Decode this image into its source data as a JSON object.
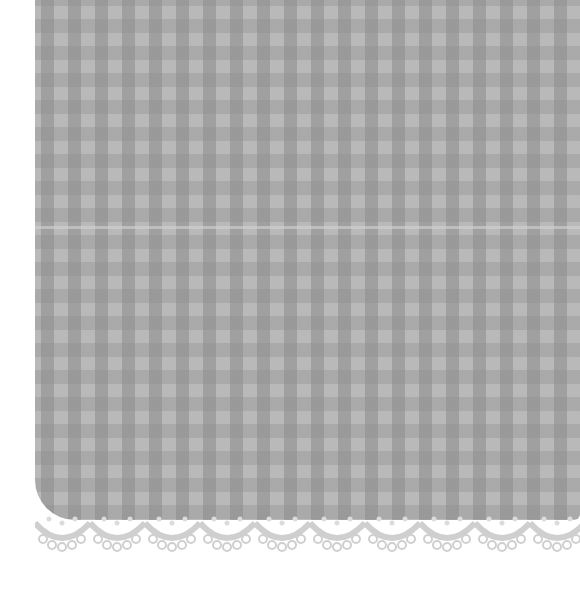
{
  "image": {
    "subject": "Gray gingham fabric with scalloped lace trim",
    "colors": {
      "background": "#ffffff",
      "fabric_light": "#b9b9b9",
      "fabric_dark": "#8f8f8f",
      "lace": "#c8c8c8"
    },
    "pattern": {
      "type": "gingham",
      "period_px": 27
    }
  }
}
